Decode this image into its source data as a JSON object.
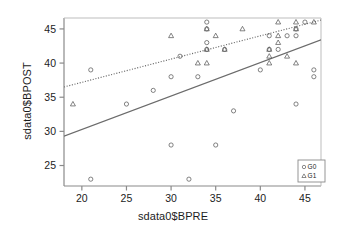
{
  "chart_data": {
    "type": "scatter",
    "title": "",
    "xlabel": "sdata0$BPRE",
    "ylabel": "sdata0$BPOST",
    "xlim": [
      18.0,
      46.8
    ],
    "ylim": [
      22.0,
      46.6
    ],
    "xticks": [
      20,
      25,
      30,
      35,
      40,
      45
    ],
    "yticks": [
      25,
      30,
      35,
      40,
      45
    ],
    "grid": false,
    "legend": {
      "position": "bottom-right",
      "entries": [
        {
          "label": "G0",
          "marker": "circle"
        },
        {
          "label": "G1",
          "marker": "triangle"
        }
      ]
    },
    "series": [
      {
        "name": "G0",
        "marker": "circle",
        "points": [
          [
            21,
            39
          ],
          [
            21,
            23
          ],
          [
            25,
            34
          ],
          [
            28,
            36
          ],
          [
            30,
            38
          ],
          [
            30,
            28
          ],
          [
            31,
            41
          ],
          [
            32,
            23
          ],
          [
            33,
            38
          ],
          [
            34,
            46
          ],
          [
            34,
            45
          ],
          [
            34,
            43
          ],
          [
            34,
            42
          ],
          [
            35,
            28
          ],
          [
            36,
            42
          ],
          [
            37,
            33
          ],
          [
            40,
            39
          ],
          [
            41,
            44
          ],
          [
            41,
            42
          ],
          [
            42,
            42
          ],
          [
            43,
            44
          ],
          [
            44,
            45
          ],
          [
            44,
            44
          ],
          [
            44,
            34
          ],
          [
            45,
            46
          ],
          [
            46,
            39
          ],
          [
            46,
            38
          ]
        ]
      },
      {
        "name": "G1",
        "marker": "triangle",
        "points": [
          [
            19,
            34
          ],
          [
            30,
            44
          ],
          [
            33,
            40
          ],
          [
            34,
            45
          ],
          [
            34,
            42
          ],
          [
            34,
            40
          ],
          [
            35,
            44
          ],
          [
            36,
            42
          ],
          [
            38,
            45
          ],
          [
            41,
            42
          ],
          [
            41,
            41
          ],
          [
            41,
            40
          ],
          [
            42,
            46
          ],
          [
            42,
            44
          ],
          [
            42,
            43
          ],
          [
            43,
            41
          ],
          [
            44,
            46
          ],
          [
            44,
            45
          ],
          [
            44,
            40
          ],
          [
            46,
            46
          ]
        ]
      }
    ],
    "fit_lines": [
      {
        "name": "G0-fit",
        "style": "solid",
        "color": "#6b6b6b",
        "x0": 18.0,
        "y0": 29.3,
        "x1": 46.8,
        "y1": 43.4
      },
      {
        "name": "G1-fit",
        "style": "dashed",
        "color": "#6b6b6b",
        "x0": 18.0,
        "y0": 36.5,
        "x1": 46.8,
        "y1": 46.3
      }
    ]
  }
}
